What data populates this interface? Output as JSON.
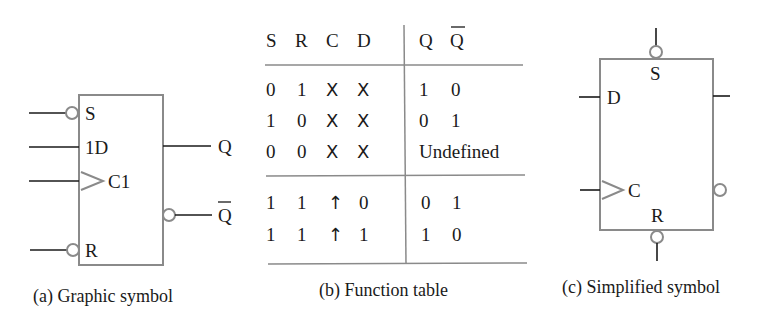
{
  "graphic_symbol": {
    "inputs": [
      "S",
      "1D",
      "C1",
      "R"
    ],
    "outputs": [
      "Q",
      "Q"
    ],
    "caption": "(a) Graphic symbol"
  },
  "function_table": {
    "headers": [
      "S",
      "R",
      "C",
      "D",
      "Q",
      "Q"
    ],
    "rows": [
      {
        "S": "0",
        "R": "1",
        "C": "X",
        "D": "X",
        "Q": "1",
        "Qbar": "0"
      },
      {
        "S": "1",
        "R": "0",
        "C": "X",
        "D": "X",
        "Q": "0",
        "Qbar": "1"
      },
      {
        "S": "0",
        "R": "0",
        "C": "X",
        "D": "X",
        "Q_combined": "Undefined"
      },
      {
        "S": "1",
        "R": "1",
        "C": "↑",
        "D": "0",
        "Q": "0",
        "Qbar": "1"
      },
      {
        "S": "1",
        "R": "1",
        "C": "↑",
        "D": "1",
        "Q": "1",
        "Qbar": "0"
      }
    ],
    "caption": "(b) Function table"
  },
  "simplified_symbol": {
    "labels": [
      "S",
      "D",
      "C",
      "R"
    ],
    "caption": "(c) Simplified symbol"
  },
  "colors": {
    "box_stroke": "#8a8a8a",
    "line": "#1a1a1a"
  }
}
